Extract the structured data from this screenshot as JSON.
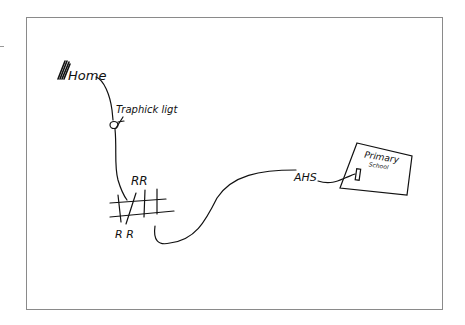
{
  "map": {
    "type": "hand-drawn sketch map",
    "stroke_color": "#111111",
    "frame_color": "#8a8a8a",
    "labels": {
      "home": "Home",
      "traffic_light": "Traphick ligt",
      "rail_top": "RR",
      "rail_bottom": "R R",
      "ahs": "AHS",
      "school_line1": "Primary",
      "school_line2": "School"
    },
    "landmarks": [
      {
        "name": "Home",
        "x": 62,
        "y": 75
      },
      {
        "name": "Traffic light",
        "x": 114,
        "y": 125
      },
      {
        "name": "Railroad crossing",
        "x": 140,
        "y": 205
      },
      {
        "name": "AHS",
        "x": 305,
        "y": 172
      },
      {
        "name": "Primary School",
        "x": 375,
        "y": 165
      }
    ]
  }
}
